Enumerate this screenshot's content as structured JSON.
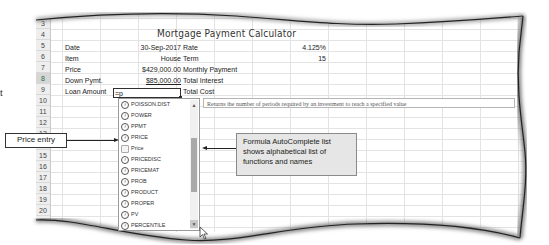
{
  "page_fragment": {
    "stray_text": "t"
  },
  "spreadsheet": {
    "title": "Mortgage Payment Calculator",
    "rows": [
      {
        "num": "2"
      },
      {
        "num": "3"
      },
      {
        "num": "4"
      },
      {
        "num": "5"
      },
      {
        "num": "6"
      },
      {
        "num": "7"
      },
      {
        "num": "8"
      },
      {
        "num": "9"
      },
      {
        "num": "10"
      },
      {
        "num": "11"
      },
      {
        "num": "12"
      },
      {
        "num": "13"
      },
      {
        "num": "14"
      },
      {
        "num": "15"
      },
      {
        "num": "16"
      },
      {
        "num": "17"
      },
      {
        "num": "18"
      },
      {
        "num": "19"
      },
      {
        "num": "20"
      },
      {
        "num": "21"
      }
    ],
    "labels": {
      "date": "Date",
      "item": "Item",
      "price": "Price",
      "down_pymt": "Down Pymt.",
      "loan_amount": "Loan Amount"
    },
    "values": {
      "date": "30-Sep-2017",
      "item": "House",
      "price": "$429,000.00",
      "down_pymt": "$85,000.00"
    },
    "right_labels": {
      "rate": "Rate",
      "term": "Term",
      "monthly_payment": "Monthly Payment",
      "total_interest": "Total Interest",
      "total_cost": "Total Cost"
    },
    "right_values": {
      "rate": "4.125%",
      "term": "15"
    },
    "active_cell": {
      "row": "8",
      "entry": "=p"
    }
  },
  "autocomplete": {
    "items": [
      {
        "label": "POISSON.DIST",
        "type": "function"
      },
      {
        "label": "POWER",
        "type": "function"
      },
      {
        "label": "PPMT",
        "type": "function"
      },
      {
        "label": "PRICE",
        "type": "function"
      },
      {
        "label": "Price",
        "type": "name"
      },
      {
        "label": "PRICEDISC",
        "type": "function"
      },
      {
        "label": "PRICEMAT",
        "type": "function"
      },
      {
        "label": "PROB",
        "type": "function"
      },
      {
        "label": "PRODUCT",
        "type": "function"
      },
      {
        "label": "PROPER",
        "type": "function"
      },
      {
        "label": "PV",
        "type": "function"
      },
      {
        "label": "PERCENTILE",
        "type": "function"
      }
    ],
    "tooltip": "Returns the number of periods required by an investment to reach a specified value",
    "scroll_up": "▲",
    "scroll_down": "▼"
  },
  "callouts": {
    "price_entry": "Price entry",
    "autocomplete_note": "Formula AutoComplete list shows alphabetical list of functions and names"
  },
  "colors": {
    "row_header_bg": "#eeeeee",
    "active_row_header": "#d6d6d6",
    "callout_bg": "#e6e6e6",
    "scroll_thumb": "#a9a9a9",
    "grid_line": "#e3e3e3"
  }
}
